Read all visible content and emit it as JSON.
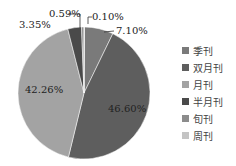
{
  "chart_data": {
    "type": "pie",
    "title": "",
    "categories": [
      "季刊",
      "双月刊",
      "月刊",
      "半月刊",
      "旬刊",
      "周刊"
    ],
    "values": [
      7.1,
      46.6,
      42.26,
      3.35,
      0.59,
      0.1
    ],
    "labels": [
      "7.10%",
      "46.60%",
      "42.26%",
      "3.35%",
      "0.59%",
      "0.10%"
    ],
    "colors": [
      "#7a7a7a",
      "#5e5e5e",
      "#a3a3a3",
      "#4a4a4a",
      "#8c8c8c",
      "#c4c4c4"
    ],
    "legend_position": "right"
  },
  "legend": {
    "items": [
      {
        "label": "季刊",
        "color": "#7a7a7a"
      },
      {
        "label": "双月刊",
        "color": "#5e5e5e"
      },
      {
        "label": "月刊",
        "color": "#a3a3a3"
      },
      {
        "label": "半月刊",
        "color": "#4a4a4a"
      },
      {
        "label": "旬刊",
        "color": "#8c8c8c"
      },
      {
        "label": "周刊",
        "color": "#c4c4c4"
      }
    ]
  },
  "annotations": {
    "jikan": "7.10%",
    "shuangyuekan": "46.60%",
    "yuekan": "42.26%",
    "banyuekan": "3.35%",
    "xunkan": "0.59%",
    "zhoukan": "0.10%"
  }
}
